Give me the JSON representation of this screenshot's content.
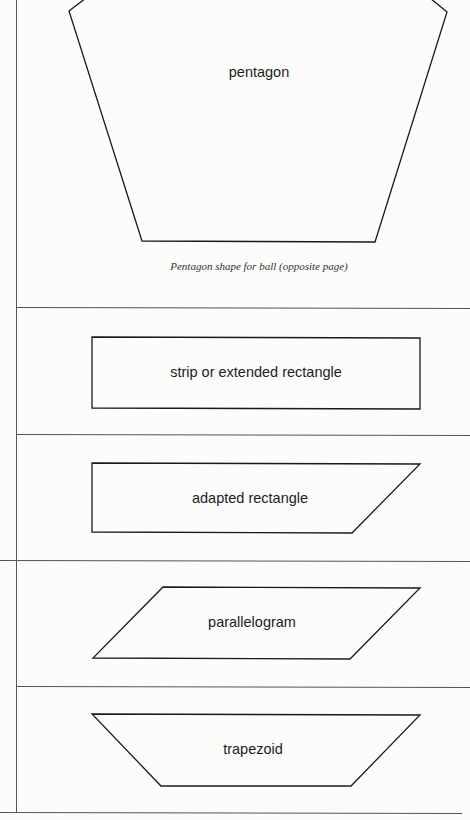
{
  "figure": {
    "stroke_color": "#1a1a1a",
    "rule_color": "#555555",
    "shapes": [
      {
        "id": "pentagon",
        "label": "pentagon",
        "caption": "Pentagon shape for ball (opposite page)"
      },
      {
        "id": "strip",
        "label": "strip or extended rectangle"
      },
      {
        "id": "adapted-rectangle",
        "label": "adapted rectangle"
      },
      {
        "id": "parallelogram",
        "label": "parallelogram"
      },
      {
        "id": "trapezoid",
        "label": "trapezoid"
      }
    ]
  }
}
